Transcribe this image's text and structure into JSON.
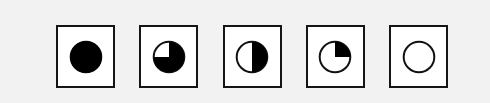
{
  "figure": {
    "name": "harvey-ball-fill-scale",
    "background_color": "#f2f2f2",
    "panel_color": "#ffffff",
    "border_color": "#151515",
    "fill_color": "#000000",
    "symbol_count": 5,
    "symbols": [
      {
        "id": "symbol-full",
        "label": "Full",
        "fill_fraction": 1,
        "fill_percent": "100%",
        "description": "Solid filled circle"
      },
      {
        "id": "symbol-three-quarter",
        "label": "Three quarters",
        "fill_fraction": 0.75,
        "fill_percent": "75%",
        "description": "Circle filled except upper-left quadrant"
      },
      {
        "id": "symbol-half",
        "label": "Half",
        "fill_fraction": 0.5,
        "fill_percent": "50%",
        "description": "Circle with right half filled"
      },
      {
        "id": "symbol-quarter",
        "label": "Quarter",
        "fill_fraction": 0.25,
        "fill_percent": "25%",
        "description": "Circle with upper-right quadrant filled"
      },
      {
        "id": "symbol-empty",
        "label": "Empty",
        "fill_fraction": 0,
        "fill_percent": "0%",
        "description": "Empty outlined circle"
      }
    ]
  }
}
